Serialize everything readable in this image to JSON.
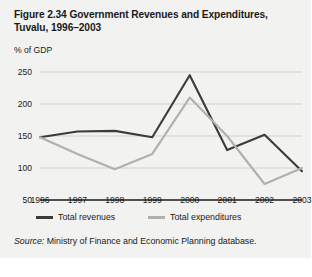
{
  "figure": {
    "title": "Figure 2.34  Government Revenues and Expenditures, Tuvalu, 1996–2003",
    "y_axis_caption": "% of GDP",
    "source_label": "Source:",
    "source_text": " Ministry of Finance and Economic Planning database.",
    "panel_bg": "#f2f2f0",
    "grid_color": "#c8c8c6",
    "axis_color": "#1a1a1a"
  },
  "chart_data": {
    "type": "line",
    "title": "Figure 2.34  Government Revenues and Expenditures, Tuvalu, 1996–2003",
    "xlabel": "",
    "ylabel": "% of GDP",
    "categories": [
      "1996",
      "1997",
      "1998",
      "1999",
      "2000",
      "2001",
      "2002",
      "2003"
    ],
    "x": [
      1996,
      1997,
      1998,
      1999,
      2000,
      2001,
      2002,
      2003
    ],
    "ylim": [
      50,
      250
    ],
    "yticks": [
      50,
      100,
      150,
      200,
      250
    ],
    "grid": true,
    "legend_position": "bottom",
    "series": [
      {
        "name": "Total revenues",
        "color": "#3b3b3b",
        "values": [
          148,
          157,
          158,
          148,
          245,
          128,
          152,
          95
        ]
      },
      {
        "name": "Total expenditures",
        "color": "#b0b0b0",
        "values": [
          148,
          122,
          98,
          122,
          210,
          150,
          75,
          100
        ]
      }
    ]
  }
}
